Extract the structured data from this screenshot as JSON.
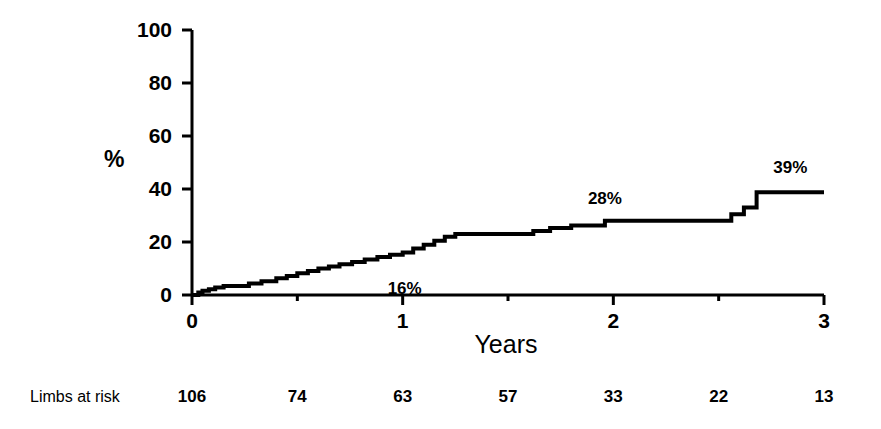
{
  "figure": {
    "background": "#ffffff",
    "ink_color": "#000000"
  },
  "chart_data": {
    "type": "line",
    "title": "",
    "subtitle": "",
    "xlabel": "Years",
    "ylabel": "%",
    "xlim": [
      0,
      3
    ],
    "ylim": [
      0,
      100
    ],
    "grid": false,
    "legend": "none",
    "interpolation": "step-after",
    "line_color": "#000000",
    "line_width_px": 4,
    "xticks": [
      0,
      1,
      2,
      3
    ],
    "xtick_labels": [
      "0",
      "1",
      "2",
      "3"
    ],
    "xminor_ticks": [
      0.5,
      1.5,
      2.5
    ],
    "yticks": [
      0,
      20,
      40,
      60,
      80,
      100
    ],
    "ytick_labels": [
      "0",
      "20",
      "40",
      "60",
      "80",
      "100"
    ],
    "series": [
      {
        "name": "cumulative-event-rate",
        "x": [
          0.0,
          0.03,
          0.05,
          0.08,
          0.11,
          0.15,
          0.19,
          0.23,
          0.27,
          0.33,
          0.4,
          0.45,
          0.5,
          0.55,
          0.6,
          0.65,
          0.7,
          0.76,
          0.82,
          0.88,
          0.94,
          1.0,
          1.05,
          1.1,
          1.15,
          1.2,
          1.25,
          1.62,
          1.7,
          1.8,
          1.96,
          2.5,
          2.56,
          2.62,
          2.68,
          3.0
        ],
        "y": [
          0.0,
          1.0,
          1.6,
          2.2,
          2.8,
          3.4,
          3.4,
          3.4,
          4.3,
          5.2,
          6.3,
          7.2,
          8.2,
          9.0,
          10.0,
          10.8,
          11.6,
          12.5,
          13.4,
          14.3,
          15.2,
          16.0,
          17.5,
          19.0,
          20.5,
          22.0,
          23.0,
          24.2,
          25.3,
          26.2,
          28.0,
          28.0,
          30.5,
          33.0,
          38.8,
          38.8
        ]
      }
    ],
    "annotations": [
      {
        "text": "16%",
        "x": 1.0,
        "y": 16.0,
        "dx_px": 2,
        "dy_px": 36,
        "name": "annotation-16-percent"
      },
      {
        "text": "28%",
        "x": 1.96,
        "y": 28.0,
        "dx_px": 0,
        "dy_px": -22,
        "name": "annotation-28-percent"
      },
      {
        "text": "39%",
        "x": 2.84,
        "y": 39.0,
        "dx_px": 0,
        "dy_px": -24,
        "name": "annotation-39-percent"
      }
    ]
  },
  "risk_table": {
    "title": "Limbs at risk",
    "positions_years": [
      0,
      0.5,
      1.0,
      1.5,
      2.0,
      2.5,
      3.0
    ],
    "values": [
      "106",
      "74",
      "63",
      "57",
      "33",
      "22",
      "13"
    ]
  }
}
